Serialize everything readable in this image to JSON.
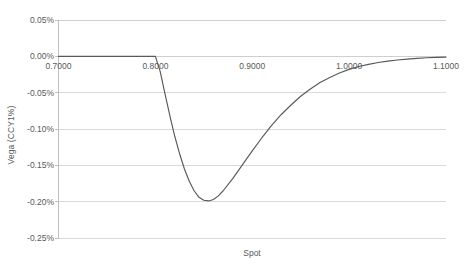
{
  "chart_data": {
    "type": "line",
    "title": "",
    "xlabel": "Spot",
    "ylabel": "Vega (CCY1%)",
    "xlim": [
      0.7,
      1.1
    ],
    "ylim": [
      -0.25,
      0.05
    ],
    "grid": true,
    "legend": false,
    "y_unit": "percent",
    "x_tick_labels": [
      "0.7000",
      "0.8000",
      "0.9000",
      "1.0000",
      "1.1000"
    ],
    "x_ticks": [
      0.7,
      0.8,
      0.9,
      1.0,
      1.1
    ],
    "y_tick_labels": [
      "0.05%",
      "0.00%",
      "-0.05%",
      "-0.10%",
      "-0.15%",
      "-0.20%",
      "-0.25%"
    ],
    "y_ticks": [
      0.05,
      0.0,
      -0.05,
      -0.1,
      -0.15,
      -0.2,
      -0.25
    ],
    "series": [
      {
        "name": "Vega",
        "color": "#595959",
        "x": [
          0.7,
          0.72,
          0.74,
          0.76,
          0.78,
          0.795,
          0.8,
          0.805,
          0.81,
          0.815,
          0.82,
          0.825,
          0.83,
          0.835,
          0.84,
          0.845,
          0.85,
          0.855,
          0.86,
          0.865,
          0.87,
          0.88,
          0.89,
          0.9,
          0.91,
          0.92,
          0.93,
          0.94,
          0.95,
          0.96,
          0.97,
          0.98,
          0.99,
          1.0,
          1.01,
          1.02,
          1.03,
          1.04,
          1.05,
          1.06,
          1.07,
          1.08,
          1.09,
          1.1
        ],
        "values": [
          0.0,
          0.0,
          0.0,
          0.0,
          0.0,
          0.0,
          0.0,
          -0.021,
          -0.052,
          -0.082,
          -0.11,
          -0.134,
          -0.155,
          -0.172,
          -0.185,
          -0.194,
          -0.198,
          -0.199,
          -0.197,
          -0.192,
          -0.185,
          -0.168,
          -0.149,
          -0.13,
          -0.112,
          -0.095,
          -0.08,
          -0.067,
          -0.055,
          -0.045,
          -0.036,
          -0.029,
          -0.023,
          -0.018,
          -0.014,
          -0.011,
          -0.0085,
          -0.0065,
          -0.005,
          -0.0038,
          -0.0028,
          -0.002,
          -0.0014,
          -0.001
        ]
      }
    ],
    "annotations": {
      "minimum_value": "-0.20%",
      "minimum_at_spot": "0.8550",
      "flat_region": "0.7000 to 0.8000"
    }
  },
  "colors": {
    "line": "#595959",
    "gridline": "#d9d9d9",
    "axis_line": "#bfbfbf",
    "tick_mark": "#bfbfbf",
    "text": "#595959",
    "background": "#ffffff"
  }
}
